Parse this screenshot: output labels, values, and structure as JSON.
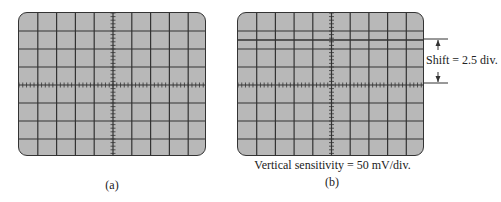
{
  "figure": {
    "panels": [
      {
        "id": "a",
        "label": "(a)",
        "grid": {
          "columns": 10,
          "rows": 8
        },
        "trace": null
      },
      {
        "id": "b",
        "label": "(b)",
        "grid": {
          "columns": 10,
          "rows": 8
        },
        "trace": {
          "shift_divisions": 2.5,
          "direction": "up"
        },
        "shift_annotation": "Shift = 2.5 div.",
        "sensitivity_caption": "Vertical sensitivity = 50 mV/div."
      }
    ],
    "colors": {
      "screen_bg": "#b8b8b8",
      "grid_line": "#333333",
      "background": "#ffffff"
    }
  }
}
